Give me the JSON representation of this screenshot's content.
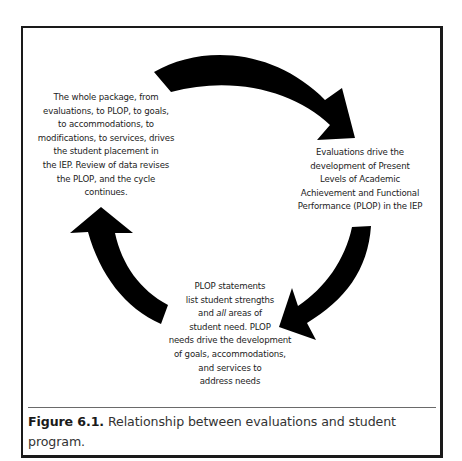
{
  "figure": {
    "label": "Figure 6.1.",
    "caption": " Relationship between evaluations and student program."
  },
  "nodes": {
    "left": {
      "lines": [
        "The whole package, from",
        "evaluations, to PLOP, to goals,",
        "to accommodations, to",
        "modifications, to services, drives",
        "the student placement in",
        "the IEP. Review of data revises",
        "the PLOP, and the cycle",
        "continues."
      ]
    },
    "right": {
      "lines": [
        "Evaluations drive the",
        "development of Present",
        "Levels of Academic",
        "Achievement and Functional",
        "Performance (PLOP) in the IEP"
      ]
    },
    "bottom": {
      "lines": [
        "PLOP statements",
        "list student strengths",
        "and ",
        "all",
        " areas of",
        "student need. PLOP",
        "needs drive the development",
        "of goals, accommodations,",
        "and services to",
        "address needs"
      ]
    }
  },
  "arrows": [
    {
      "name": "arrow-top",
      "from": "left",
      "to": "right",
      "direction": "clockwise"
    },
    {
      "name": "arrow-right",
      "from": "right",
      "to": "bottom",
      "direction": "clockwise"
    },
    {
      "name": "arrow-left",
      "from": "bottom",
      "to": "left",
      "direction": "clockwise"
    }
  ],
  "colors": {
    "arrow": "#000000",
    "frame": "#1a1a1a",
    "text": "#1c1c1c",
    "divider": "#6a6a6a"
  }
}
